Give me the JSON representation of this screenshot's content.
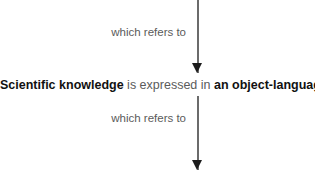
{
  "diagram": {
    "type": "vertical-flow",
    "background_color": "#ffffff",
    "arrow_color": "#6b6b6b",
    "arrowhead_color": "#1c1c1c",
    "bold_text_color": "#111111",
    "regular_text_color": "#5b5b5b",
    "edges": [
      {
        "id": "edge-top",
        "label": "which refers to",
        "direction": "down"
      },
      {
        "id": "edge-bottom",
        "label": "which refers to",
        "direction": "down"
      }
    ],
    "statement": {
      "subject": "Scientific knowledge",
      "copula": " is expressed in ",
      "object": "an object-language"
    }
  }
}
